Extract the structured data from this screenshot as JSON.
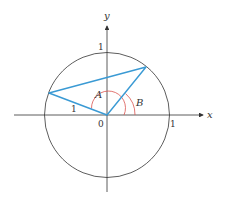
{
  "diagram": {
    "type": "unit-circle-angle-difference",
    "axes": {
      "x_label": "x",
      "y_label": "y",
      "origin_label": "0",
      "x_tick_label": "1",
      "y_tick_label": "1"
    },
    "triangle": {
      "side_label": "1",
      "color": "#3a9ad4"
    },
    "angles": [
      {
        "label": "A",
        "color": "#d9534f"
      },
      {
        "label": "B",
        "color": "#d9534f"
      }
    ],
    "circle_color": "#333333",
    "axis_color": "#333333"
  }
}
